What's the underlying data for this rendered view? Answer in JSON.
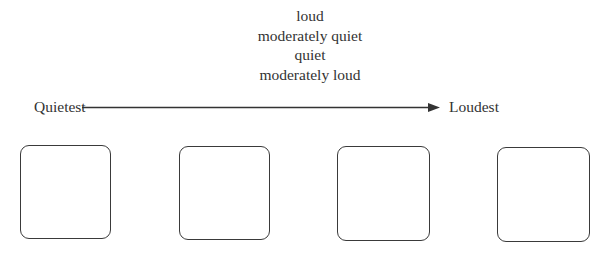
{
  "word_bank": {
    "items": [
      "loud",
      "moderately quiet",
      "quiet",
      "moderately loud"
    ]
  },
  "scale": {
    "left_label": "Quietest",
    "right_label": "Loudest",
    "arrow_direction": "left-to-right"
  },
  "answer_boxes": [
    {
      "position": 1,
      "value": ""
    },
    {
      "position": 2,
      "value": ""
    },
    {
      "position": 3,
      "value": ""
    },
    {
      "position": 4,
      "value": ""
    }
  ],
  "colors": {
    "text": "#333333",
    "stroke": "#3a3a3a",
    "background": "#ffffff"
  }
}
